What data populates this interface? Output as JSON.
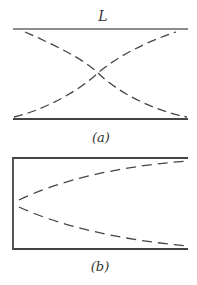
{
  "figure_a": {
    "label_top": "L",
    "caption": "(a)",
    "description": "Two parallel horizontal lines with two dashed curves crossing at the center"
  },
  "figure_b": {
    "caption": "(b)",
    "description": "Closed box on the left with two dashed curves diverging from the left wall toward the right corners"
  },
  "colors": {
    "line": "#555555",
    "dash": "#444444",
    "background": "#ffffff"
  }
}
